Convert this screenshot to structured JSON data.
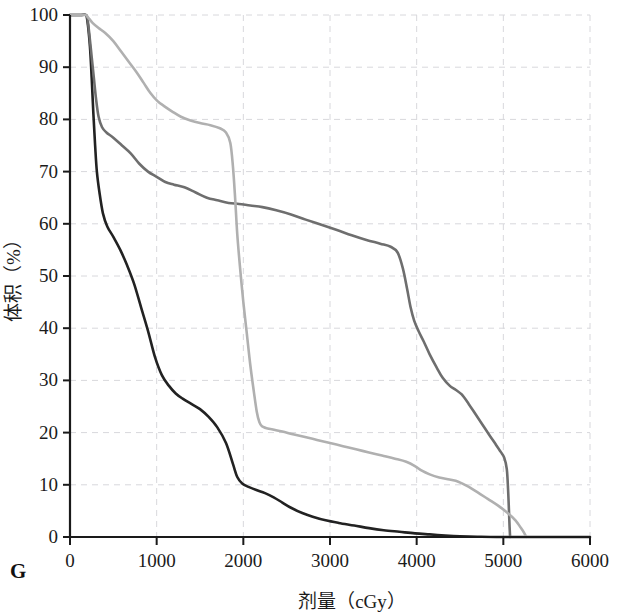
{
  "figure": {
    "panel_letter": "G"
  },
  "chart_data": {
    "type": "line",
    "title": "",
    "xlabel": "剂量（cGy）",
    "ylabel": "体积（%）",
    "xlim": [
      0,
      6000
    ],
    "ylim": [
      0,
      100
    ],
    "xticks": [
      0,
      1000,
      2000,
      3000,
      4000,
      5000,
      6000
    ],
    "yticks": [
      0,
      10,
      20,
      30,
      40,
      50,
      60,
      70,
      80,
      90,
      100
    ],
    "xtick_labels": [
      "0",
      "1000",
      "2000",
      "3000",
      "4000",
      "5000",
      "6000"
    ],
    "ytick_labels": [
      "0",
      "10",
      "20",
      "30",
      "40",
      "50",
      "60",
      "70",
      "80",
      "90",
      "100"
    ],
    "grid": true,
    "grid_style": "dashed",
    "grid_color": "#d8d8dc",
    "legend": "none",
    "series": [
      {
        "name": "dark-curve",
        "color": "#222222",
        "width": 2.6,
        "points": [
          [
            0,
            100
          ],
          [
            120,
            100
          ],
          [
            180,
            100
          ],
          [
            200,
            99
          ],
          [
            230,
            94
          ],
          [
            250,
            88
          ],
          [
            270,
            81
          ],
          [
            290,
            75
          ],
          [
            310,
            70
          ],
          [
            340,
            66
          ],
          [
            380,
            62
          ],
          [
            430,
            59.5
          ],
          [
            500,
            57.5
          ],
          [
            580,
            55
          ],
          [
            660,
            52
          ],
          [
            740,
            48.5
          ],
          [
            820,
            44
          ],
          [
            900,
            39.5
          ],
          [
            980,
            34.5
          ],
          [
            1060,
            31
          ],
          [
            1140,
            29
          ],
          [
            1220,
            27.5
          ],
          [
            1300,
            26.5
          ],
          [
            1400,
            25.5
          ],
          [
            1500,
            24.5
          ],
          [
            1600,
            23
          ],
          [
            1700,
            21
          ],
          [
            1800,
            18
          ],
          [
            1880,
            14
          ],
          [
            1930,
            11.5
          ],
          [
            1990,
            10.2
          ],
          [
            2060,
            9.6
          ],
          [
            2150,
            9.0
          ],
          [
            2250,
            8.4
          ],
          [
            2350,
            7.6
          ],
          [
            2450,
            6.6
          ],
          [
            2550,
            5.6
          ],
          [
            2680,
            4.6
          ],
          [
            2800,
            3.9
          ],
          [
            2950,
            3.2
          ],
          [
            3100,
            2.7
          ],
          [
            3280,
            2.2
          ],
          [
            3450,
            1.7
          ],
          [
            3620,
            1.3
          ],
          [
            3800,
            1.0
          ],
          [
            3980,
            0.7
          ],
          [
            4150,
            0.5
          ],
          [
            4330,
            0.3
          ],
          [
            4500,
            0.15
          ],
          [
            4700,
            0.05
          ],
          [
            5000,
            0.0
          ],
          [
            6000,
            0.0
          ]
        ]
      },
      {
        "name": "medium-gray-curve",
        "color": "#6e6e6e",
        "width": 2.6,
        "points": [
          [
            0,
            100
          ],
          [
            120,
            100
          ],
          [
            180,
            100
          ],
          [
            200,
            99.5
          ],
          [
            225,
            96
          ],
          [
            250,
            92
          ],
          [
            275,
            88
          ],
          [
            300,
            84
          ],
          [
            330,
            80.5
          ],
          [
            370,
            78.5
          ],
          [
            420,
            77.5
          ],
          [
            500,
            76.5
          ],
          [
            600,
            75
          ],
          [
            700,
            73.5
          ],
          [
            800,
            71.5
          ],
          [
            900,
            70
          ],
          [
            1000,
            69
          ],
          [
            1100,
            68
          ],
          [
            1200,
            67.5
          ],
          [
            1320,
            67
          ],
          [
            1450,
            66
          ],
          [
            1580,
            65
          ],
          [
            1700,
            64.5
          ],
          [
            1830,
            64
          ],
          [
            1950,
            63.8
          ],
          [
            2080,
            63.5
          ],
          [
            2220,
            63.2
          ],
          [
            2380,
            62.6
          ],
          [
            2550,
            61.8
          ],
          [
            2720,
            60.8
          ],
          [
            2900,
            59.8
          ],
          [
            3080,
            58.8
          ],
          [
            3250,
            57.8
          ],
          [
            3420,
            56.9
          ],
          [
            3580,
            56.2
          ],
          [
            3700,
            55.6
          ],
          [
            3780,
            54.5
          ],
          [
            3840,
            51.5
          ],
          [
            3890,
            47.5
          ],
          [
            3930,
            44
          ],
          [
            3970,
            41.5
          ],
          [
            4020,
            39.5
          ],
          [
            4080,
            37.5
          ],
          [
            4150,
            35
          ],
          [
            4230,
            32.5
          ],
          [
            4300,
            30.5
          ],
          [
            4380,
            29
          ],
          [
            4450,
            28.2
          ],
          [
            4520,
            27.3
          ],
          [
            4600,
            25.5
          ],
          [
            4680,
            23.5
          ],
          [
            4760,
            21.5
          ],
          [
            4840,
            19.5
          ],
          [
            4910,
            17.8
          ],
          [
            4970,
            16.3
          ],
          [
            5010,
            15.2
          ],
          [
            5040,
            13
          ],
          [
            5055,
            9
          ],
          [
            5065,
            5
          ],
          [
            5072,
            2
          ],
          [
            5078,
            0
          ]
        ]
      },
      {
        "name": "light-gray-curve",
        "color": "#b0b0b0",
        "width": 2.6,
        "points": [
          [
            0,
            100
          ],
          [
            120,
            100
          ],
          [
            180,
            100
          ],
          [
            210,
            99.5
          ],
          [
            260,
            98.5
          ],
          [
            330,
            97.5
          ],
          [
            410,
            96.5
          ],
          [
            500,
            95
          ],
          [
            590,
            93
          ],
          [
            680,
            91
          ],
          [
            770,
            89
          ],
          [
            850,
            87
          ],
          [
            930,
            85
          ],
          [
            1010,
            83.5
          ],
          [
            1090,
            82.5
          ],
          [
            1180,
            81.5
          ],
          [
            1280,
            80.5
          ],
          [
            1390,
            79.8
          ],
          [
            1500,
            79.3
          ],
          [
            1620,
            78.9
          ],
          [
            1730,
            78.3
          ],
          [
            1800,
            77.5
          ],
          [
            1850,
            75.5
          ],
          [
            1880,
            71
          ],
          [
            1905,
            65
          ],
          [
            1930,
            58
          ],
          [
            1960,
            52
          ],
          [
            2000,
            45
          ],
          [
            2040,
            39
          ],
          [
            2080,
            33
          ],
          [
            2120,
            28
          ],
          [
            2155,
            24
          ],
          [
            2185,
            22
          ],
          [
            2215,
            21.2
          ],
          [
            2260,
            20.9
          ],
          [
            2340,
            20.6
          ],
          [
            2450,
            20.2
          ],
          [
            2570,
            19.7
          ],
          [
            2700,
            19.2
          ],
          [
            2850,
            18.6
          ],
          [
            3000,
            18.0
          ],
          [
            3150,
            17.4
          ],
          [
            3300,
            16.8
          ],
          [
            3450,
            16.2
          ],
          [
            3600,
            15.6
          ],
          [
            3750,
            15.0
          ],
          [
            3880,
            14.4
          ],
          [
            3980,
            13.6
          ],
          [
            4060,
            12.7
          ],
          [
            4150,
            12.0
          ],
          [
            4260,
            11.4
          ],
          [
            4380,
            11.0
          ],
          [
            4480,
            10.6
          ],
          [
            4580,
            9.8
          ],
          [
            4700,
            8.6
          ],
          [
            4820,
            7.3
          ],
          [
            4940,
            6.0
          ],
          [
            5050,
            4.6
          ],
          [
            5140,
            3.2
          ],
          [
            5200,
            1.8
          ],
          [
            5240,
            0.8
          ],
          [
            5265,
            0
          ]
        ]
      }
    ]
  }
}
